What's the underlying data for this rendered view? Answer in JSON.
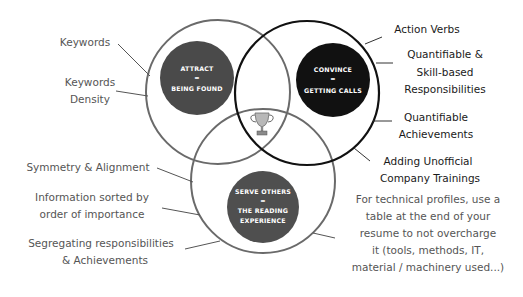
{
  "diagram": {
    "type": "venn",
    "colors": {
      "attract_fill": "#4a4a4a",
      "convince_fill": "#111111",
      "serve_fill": "#4f4f4f",
      "gray_outline": "#6a6a6a",
      "dark_outline": "#111111",
      "left_text": "#555555",
      "right_text": "#1a1a1a"
    },
    "circles": {
      "attract": {
        "line1": "ATTRACT",
        "line2": "=",
        "line3": "BEING FOUND"
      },
      "convince": {
        "line1": "CONVINCE",
        "line2": "=",
        "line3": "GETTING CALLS"
      },
      "serve": {
        "line1": "SERVE OTHERS",
        "line2": "=",
        "line3": "THE READING",
        "line4": "EXPERIENCE"
      }
    },
    "center_icon": "trophy-icon",
    "left_labels": {
      "keywords": "Keywords",
      "density_1": "Keywords",
      "density_2": "Density",
      "symmetry": "Symmetry & Alignment",
      "info_1": "Information sorted by",
      "info_2": "order of importance",
      "seg_1": "Segregating responsibilities",
      "seg_2": "& Achievements"
    },
    "right_labels": {
      "action": "Action Verbs",
      "quant_1": "Quantifiable &",
      "quant_2": "Skill-based",
      "quant_3": "Responsibilities",
      "ach_1": "Quantifiable",
      "ach_2": "Achievements",
      "train_1": "Adding Unofficial",
      "train_2": "Company Trainings",
      "tech_1": "For technical profiles, use a",
      "tech_2": "table at the end of your",
      "tech_3": "resume to not overcharge",
      "tech_4": "it (tools, methods, IT,",
      "tech_5": "material / machinery used...)"
    }
  }
}
